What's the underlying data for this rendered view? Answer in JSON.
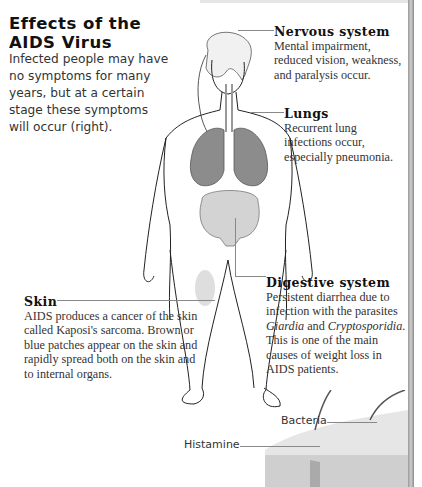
{
  "title": {
    "line1": "Effects of the",
    "line2": "AIDS Virus"
  },
  "intro": "Infected people may have no symptoms for many years, but at a certain stage these symptoms will occur (right).",
  "callouts": {
    "nervous": {
      "heading": "Nervous system",
      "text": "Mental impairment, reduced vision, weakness, and paralysis occur."
    },
    "lungs": {
      "heading": "Lungs",
      "text": "Recurrent lung infections occur, especially pneumonia."
    },
    "digestive": {
      "heading": "Digestive system",
      "text_1": "Persistent diarrhea due to infection with the parasites",
      "italic_1": "Giardia",
      "and": " and ",
      "italic_2": "Cryptosporidia",
      "text_2": ". This is one of the main causes of weight loss in AIDS patients."
    },
    "skin": {
      "heading": "Skin",
      "text": "AIDS produces a cancer of the skin called Kaposi's sarcoma. Brown or blue patches appear on the skin and rapidly spread both on the skin and to internal organs."
    }
  },
  "skin_diagram": {
    "labels": {
      "bacteria": "Bacteria",
      "histamine": "Histamine"
    }
  },
  "colors": {
    "lungs": "#8c8c8c",
    "intestine": "#cfcfcf",
    "outline": "#1a1a1a",
    "leader": "#888888"
  }
}
